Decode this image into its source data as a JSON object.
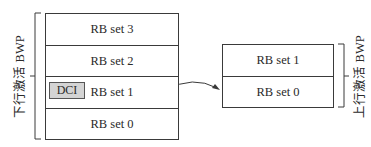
{
  "downlink_bwp": {
    "label": "下行激活 BWP",
    "rows": [
      "RB set 3",
      "RB set 2",
      "RB set 1",
      "RB set 0"
    ],
    "dci_label": "DCI",
    "dci_row": "RB set 1"
  },
  "uplink_bwp": {
    "label": "上行激活 BWP",
    "rows": [
      "RB set 1",
      "RB set 0"
    ]
  },
  "arrow": {
    "from": "downlink RB set 1 (DCI)",
    "to": "uplink RB set 0"
  },
  "colors": {
    "line": "#3a3a3a",
    "dci_fill": "#d4d4d4",
    "background": "#ffffff"
  }
}
